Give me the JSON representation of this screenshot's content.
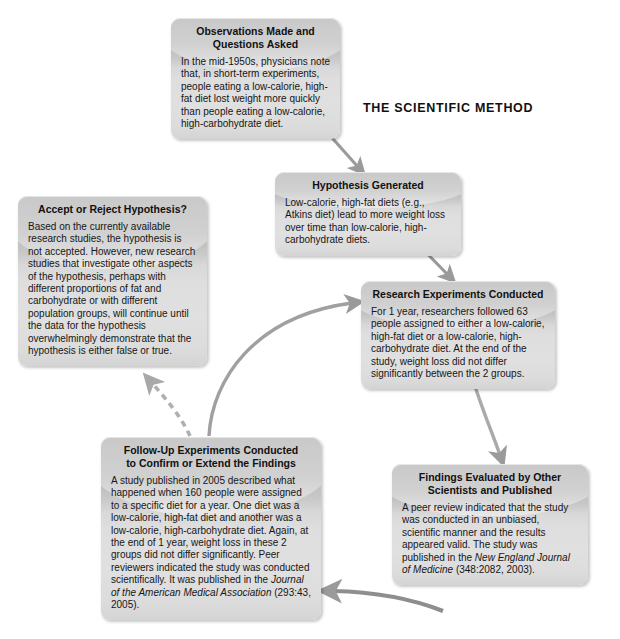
{
  "diagram": {
    "title": "THE SCIENTIFIC METHOD",
    "type": "cycle-flowchart",
    "nodes": [
      {
        "id": "observations",
        "title": "Observations Made and Questions Asked",
        "title_line1": "Observations Made and",
        "title_line2": "Questions Asked",
        "body": "In the mid-1950s, physicians note that, in short-term experiments, people eating a low-calorie, high-fat diet lost weight more quickly than people eating a low-calorie, high-carbohydrate diet."
      },
      {
        "id": "hypothesis",
        "title": "Hypothesis Generated",
        "body": "Low-calorie, high-fat diets (e.g., Atkins diet) lead to more weight loss over time than low-calorie, high-carbohydrate diets."
      },
      {
        "id": "research",
        "title": "Research Experiments Conducted",
        "body": "For 1 year, researchers followed 63 people assigned to either a low-calorie, high-fat diet or a low-calorie, high-carbohydrate diet. At the end of the study, weight loss did not differ significantly between the 2 groups."
      },
      {
        "id": "findings",
        "title": "Findings Evaluated by Other Scientists and Published",
        "title_line1": "Findings Evaluated by Other",
        "title_line2": "Scientists and Published",
        "body_part1": "A peer review indicated that the study was conducted in an unbiased, scientific manner and the results appeared valid. The study was published in the ",
        "body_italic": "New England Journal of Medicine",
        "body_part2": " (348:2082, 2003)."
      },
      {
        "id": "followup",
        "title": "Follow-Up Experiments Conducted to Confirm or Extend the Findings",
        "title_line1": "Follow-Up Experiments Conducted",
        "title_line2": "to Confirm or Extend the Findings",
        "body_part1": "A study published in 2005 described what happened when 160 people were assigned to a specific diet for a year. One diet was a low-calorie, high-fat diet and another was a low-calorie, high-carbohydrate diet. Again, at the end of 1 year, weight loss in these 2 groups did not differ significantly. Peer reviewers indicated the study was conducted scientifically. It was published in the ",
        "body_italic": "Journal of the American Medical Association",
        "body_part2": " (293:43, 2005)."
      },
      {
        "id": "accept",
        "title": "Accept or Reject Hypothesis?",
        "body": "Based on the currently available research studies, the hypothesis is not accepted. However, new research studies that investigate other aspects of the hypothesis, perhaps with different proportions of fat and carbohydrate or with different population groups, will continue until the data for the hypothesis overwhelmingly demonstrate that the hypothesis is either false or true."
      }
    ],
    "connectors": [
      {
        "id": "observations-to-hypothesis",
        "from": "observations",
        "to": "hypothesis",
        "style": "solid"
      },
      {
        "id": "hypothesis-to-research",
        "from": "hypothesis",
        "to": "research",
        "style": "solid"
      },
      {
        "id": "research-to-findings",
        "from": "research",
        "to": "findings",
        "style": "solid"
      },
      {
        "id": "findings-to-followup",
        "from": "findings",
        "to": "followup",
        "style": "solid"
      },
      {
        "id": "followup-to-research",
        "from": "followup",
        "to": "research",
        "style": "solid"
      },
      {
        "id": "followup-to-accept",
        "from": "followup",
        "to": "accept",
        "style": "dashed"
      }
    ],
    "colors": {
      "box_top": "#b4b4b4",
      "box_body": "#dedede",
      "arrow": "#9a9a9a",
      "text": "#111111",
      "background": "#ffffff"
    }
  }
}
